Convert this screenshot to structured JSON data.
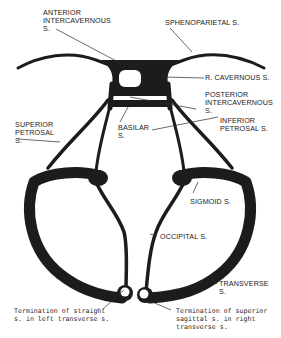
{
  "diagram": {
    "type": "anatomical-line-drawing",
    "ink_color": "#1c1c1c",
    "background": "#ffffff"
  },
  "labels": {
    "anterior_intercavernous": "ANTERIOR\nINTERCAVERNOUS\nS.",
    "sphenoparietal": "SPHENOPARIETAL S.",
    "r_cavernous": "R. CAVERNOUS S.",
    "posterior_intercavernous": "POSTERIOR\nINTERCAVERNOUS\nS.",
    "superior_petrosal": "SUPERIOR\nPETROSAL\nS.",
    "basilar": "BASILAR\nS.",
    "inferior_petrosal": "INFERIOR\nPETROSAL S.",
    "sigmoid": "SIGMOID S.",
    "occipital": "OCCIPITAL S.",
    "transverse": "TRANSVERSE\nS.",
    "termination_straight": "Termination of straight\ns. in left transverse s.",
    "termination_superior_sagittal": "Termination of superior\nsagittal s. in right\ntransverse s."
  }
}
